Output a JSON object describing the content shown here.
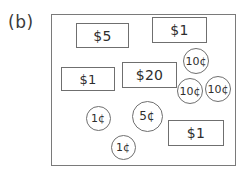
{
  "figure": {
    "panel_label": "(b)",
    "outline_color": "#7a7a7a",
    "item_color": "#6f6f6f",
    "text_color": "#2e2e2e",
    "background": "#ffffff"
  },
  "bills": [
    {
      "denomination": "$5",
      "x": 76,
      "y": 23,
      "w": 53,
      "h": 25,
      "font_size": 14
    },
    {
      "denomination": "$1",
      "x": 152,
      "y": 17,
      "w": 55,
      "h": 26,
      "font_size": 14
    },
    {
      "denomination": "$1",
      "x": 61,
      "y": 67,
      "w": 54,
      "h": 24,
      "font_size": 13
    },
    {
      "denomination": "$20",
      "x": 122,
      "y": 62,
      "w": 55,
      "h": 26,
      "font_size": 14
    },
    {
      "denomination": "$1",
      "x": 168,
      "y": 120,
      "w": 56,
      "h": 26,
      "font_size": 14
    }
  ],
  "coins": [
    {
      "denomination": "10¢",
      "cx": 196,
      "cy": 61,
      "r": 13,
      "font_size": 11
    },
    {
      "denomination": "10¢",
      "cx": 190,
      "cy": 91,
      "r": 13,
      "font_size": 11
    },
    {
      "denomination": "10¢",
      "cx": 218,
      "cy": 89,
      "r": 13,
      "font_size": 11
    },
    {
      "denomination": "1¢",
      "cx": 98,
      "cy": 118,
      "r": 12.5,
      "font_size": 11
    },
    {
      "denomination": "5¢",
      "cx": 147,
      "cy": 116,
      "r": 15.5,
      "font_size": 12
    },
    {
      "denomination": "1¢",
      "cx": 123,
      "cy": 147,
      "r": 12.5,
      "font_size": 11
    }
  ],
  "totals": {
    "bills_count": 5,
    "coins_count": 6
  }
}
